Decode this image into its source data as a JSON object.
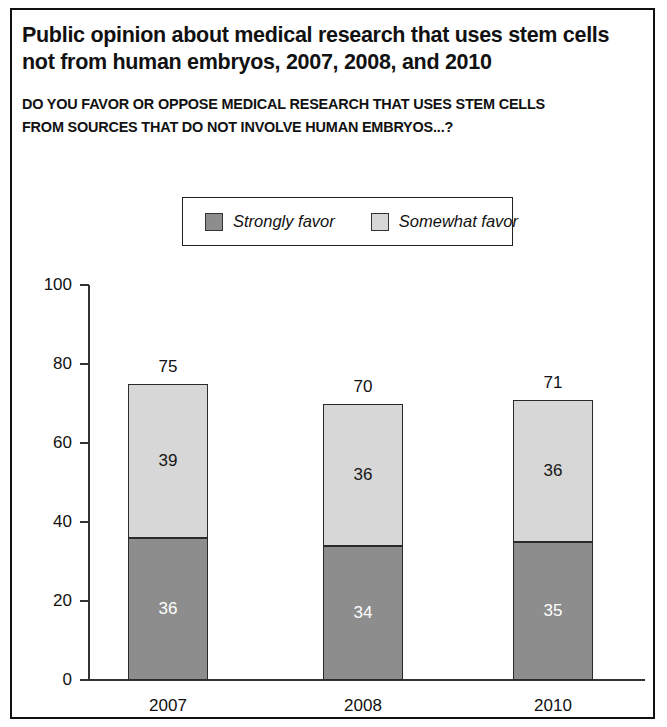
{
  "title": {
    "line1": "Public opinion about medical research that uses stem cells",
    "line2": "not from human embryos, 2007, 2008, and 2010"
  },
  "subtitle": {
    "line1": "DO YOU FAVOR OR OPPOSE MEDICAL RESEARCH THAT USES STEM CELLS",
    "line2": "FROM SOURCES THAT DO NOT INVOLVE HUMAN EMBRYOS...?"
  },
  "legend": {
    "items": [
      {
        "label": "Strongly favor",
        "color": "#8d8d8d",
        "swatch_name": "legend-swatch-strongly-favor"
      },
      {
        "label": "Somewhat favor",
        "color": "#d7d7d7",
        "swatch_name": "legend-swatch-somewhat-favor"
      }
    ]
  },
  "axis": {
    "y_ticks": [
      "0",
      "20",
      "40",
      "60",
      "80",
      "100"
    ],
    "x_labels": [
      "2007",
      "2008",
      "2010"
    ]
  },
  "bars": [
    {
      "category": "2007",
      "total": "75",
      "strongly": "36",
      "somewhat": "39"
    },
    {
      "category": "2008",
      "total": "70",
      "strongly": "34",
      "somewhat": "36"
    },
    {
      "category": "2010",
      "total": "71",
      "strongly": "35",
      "somewhat": "36"
    }
  ],
  "chart_data": {
    "type": "bar",
    "subtype": "stacked-vertical",
    "title": "Public opinion about medical research that uses stem cells not from human embryos, 2007, 2008, and 2010",
    "subtitle": "DO YOU FAVOR OR OPPOSE MEDICAL RESEARCH THAT USES STEM CELLS FROM SOURCES THAT DO NOT INVOLVE HUMAN EMBRYOS...?",
    "categories": [
      "2007",
      "2008",
      "2010"
    ],
    "series": [
      {
        "name": "Strongly favor",
        "values": [
          36,
          34,
          35
        ],
        "color": "#8d8d8d"
      },
      {
        "name": "Somewhat favor",
        "values": [
          39,
          36,
          36
        ],
        "color": "#d7d7d7"
      }
    ],
    "totals": [
      75,
      70,
      71
    ],
    "xlabel": "",
    "ylabel": "",
    "ylim": [
      0,
      100
    ],
    "yticks": [
      0,
      20,
      40,
      60,
      80,
      100
    ],
    "grid": false,
    "legend_position": "top-center"
  }
}
